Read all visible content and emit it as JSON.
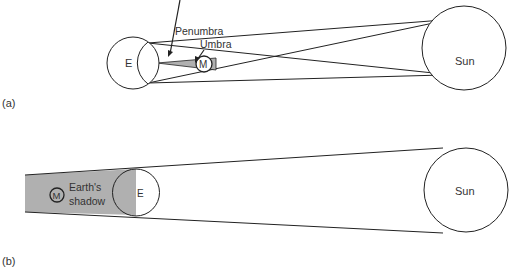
{
  "panel_a": {
    "caption": "(a)",
    "earth_label": "E",
    "moon_label": "M",
    "sun_label": "Sun",
    "penumbra_label": "Penumbra",
    "umbra_label": "Umbra"
  },
  "panel_b": {
    "caption": "(b)",
    "earth_label": "E",
    "moon_label": "M",
    "sun_label": "Sun",
    "shadow_label_line1": "Earth's",
    "shadow_label_line2": "shadow"
  },
  "colors": {
    "stroke": "#222222",
    "shadow_fill": "#b0b0b0",
    "background": "#ffffff"
  }
}
